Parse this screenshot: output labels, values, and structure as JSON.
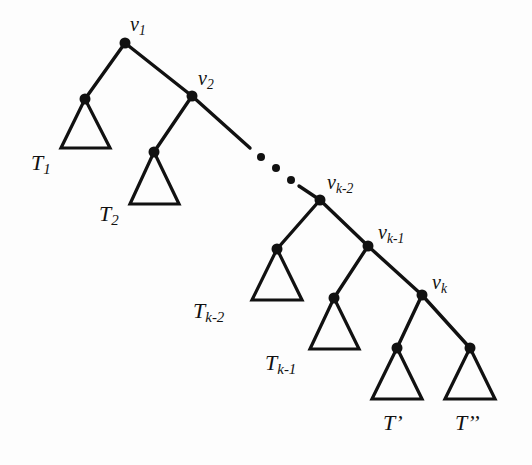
{
  "figure": {
    "type": "tree-diagram",
    "background_color": "#fdfdfd",
    "stroke_color": "#111111",
    "node_color": "#111111"
  },
  "labels": {
    "v1": {
      "base": "v",
      "sub": "1",
      "x": 130,
      "y": 14
    },
    "v2": {
      "base": "v",
      "sub": "2",
      "x": 198,
      "y": 68
    },
    "vk2": {
      "base": "v",
      "sub": "k-2",
      "x": 327,
      "y": 172
    },
    "vk1": {
      "base": "v",
      "sub": "k-1",
      "x": 378,
      "y": 222
    },
    "vk": {
      "base": "v",
      "sub": "k",
      "x": 432,
      "y": 272
    },
    "T1": {
      "base": "T",
      "sub": "1",
      "x": 31,
      "y": 152
    },
    "T2": {
      "base": "T",
      "sub": "2",
      "x": 99,
      "y": 203
    },
    "Tk2": {
      "base": "T",
      "sub": "k-2",
      "x": 193,
      "y": 300
    },
    "Tk1": {
      "base": "T",
      "sub": "k-1",
      "x": 265,
      "y": 352
    },
    "Tprime": {
      "base": "T",
      "sub": "",
      "prime": "’",
      "x": 383,
      "y": 412
    },
    "Tdprime": {
      "base": "T",
      "sub": "",
      "prime": "’’",
      "x": 455,
      "y": 412
    }
  },
  "nodes": [
    {
      "name": "v1",
      "x": 125,
      "y": 43,
      "r": 5.5
    },
    {
      "name": "v2",
      "x": 192,
      "y": 96,
      "r": 5.5
    },
    {
      "name": "t1-apex",
      "x": 85,
      "y": 99,
      "r": 5.5
    },
    {
      "name": "t2-apex",
      "x": 154,
      "y": 152,
      "r": 5.5
    },
    {
      "name": "vk2",
      "x": 320,
      "y": 200,
      "r": 5.5
    },
    {
      "name": "vk1",
      "x": 368,
      "y": 246,
      "r": 5.5
    },
    {
      "name": "vk",
      "x": 422,
      "y": 295,
      "r": 5.5
    },
    {
      "name": "tk2-apex",
      "x": 277,
      "y": 249,
      "r": 5.5
    },
    {
      "name": "tk1-apex",
      "x": 334,
      "y": 298,
      "r": 5.5
    },
    {
      "name": "tprime-apex",
      "x": 397,
      "y": 348,
      "r": 5.5
    },
    {
      "name": "tdprime-apex",
      "x": 470,
      "y": 348,
      "r": 5.5
    }
  ],
  "edges": [
    {
      "name": "edge-v1-t1",
      "x1": 125,
      "y1": 43,
      "x2": 85,
      "y2": 99
    },
    {
      "name": "edge-v1-v2",
      "x1": 125,
      "y1": 43,
      "x2": 192,
      "y2": 96
    },
    {
      "name": "edge-v2-t2",
      "x1": 192,
      "y1": 96,
      "x2": 154,
      "y2": 152
    },
    {
      "name": "edge-v2-ellipsis",
      "x1": 192,
      "y1": 96,
      "x2": 250,
      "y2": 148
    },
    {
      "name": "edge-ellipsis-vk2",
      "x1": 299,
      "y1": 186,
      "x2": 320,
      "y2": 200
    },
    {
      "name": "edge-vk2-tk2",
      "x1": 320,
      "y1": 200,
      "x2": 277,
      "y2": 249
    },
    {
      "name": "edge-vk2-vk1",
      "x1": 320,
      "y1": 200,
      "x2": 368,
      "y2": 246
    },
    {
      "name": "edge-vk1-tk1",
      "x1": 368,
      "y1": 246,
      "x2": 334,
      "y2": 298
    },
    {
      "name": "edge-vk1-vk",
      "x1": 368,
      "y1": 246,
      "x2": 422,
      "y2": 295
    },
    {
      "name": "edge-vk-tprime",
      "x1": 422,
      "y1": 295,
      "x2": 397,
      "y2": 348
    },
    {
      "name": "edge-vk-tdprime",
      "x1": 422,
      "y1": 295,
      "x2": 470,
      "y2": 348
    }
  ],
  "triangles": [
    {
      "name": "subtree-T1",
      "apex_x": 85,
      "apex_y": 99,
      "left_x": 61,
      "right_x": 110,
      "base_y": 148
    },
    {
      "name": "subtree-T2",
      "apex_x": 154,
      "apex_y": 152,
      "left_x": 130,
      "right_x": 179,
      "base_y": 204
    },
    {
      "name": "subtree-Tk2",
      "apex_x": 277,
      "apex_y": 249,
      "left_x": 252,
      "right_x": 302,
      "base_y": 300
    },
    {
      "name": "subtree-Tk1",
      "apex_x": 334,
      "apex_y": 298,
      "left_x": 310,
      "right_x": 359,
      "base_y": 349
    },
    {
      "name": "subtree-Tprime",
      "apex_x": 397,
      "apex_y": 348,
      "left_x": 372,
      "right_x": 422,
      "base_y": 399
    },
    {
      "name": "subtree-Tdprime",
      "apex_x": 470,
      "apex_y": 348,
      "left_x": 445,
      "right_x": 495,
      "base_y": 399
    }
  ],
  "ellipsis_dots": [
    {
      "x": 261,
      "y": 157,
      "r": 4
    },
    {
      "x": 276,
      "y": 168,
      "r": 4
    },
    {
      "x": 291,
      "y": 180,
      "r": 4
    }
  ]
}
